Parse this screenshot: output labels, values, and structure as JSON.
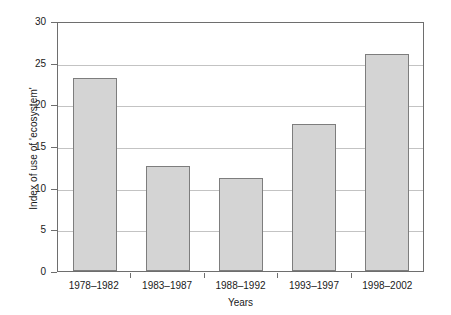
{
  "chart_data": {
    "type": "bar",
    "title": "",
    "xlabel": "Years",
    "ylabel": "Index of use of 'ecosystem'",
    "categories": [
      "1978–1982",
      "1983–1987",
      "1988–1992",
      "1993–1997",
      "1998–2002"
    ],
    "values": [
      23.2,
      12.6,
      11.2,
      17.7,
      26.1
    ],
    "ylim": [
      0,
      30
    ],
    "ytick_labels": [
      "30",
      "25",
      "20",
      "15",
      "10",
      "5",
      "0"
    ],
    "ytick_values": [
      30,
      25,
      20,
      15,
      10,
      5,
      0
    ],
    "grid": true,
    "legend": "none",
    "bar_color": "#d4d4d4",
    "bar_edge_color": "#7d7d7d",
    "grid_color": "#c3c3c3",
    "axis_color": "#6e6e6e"
  }
}
